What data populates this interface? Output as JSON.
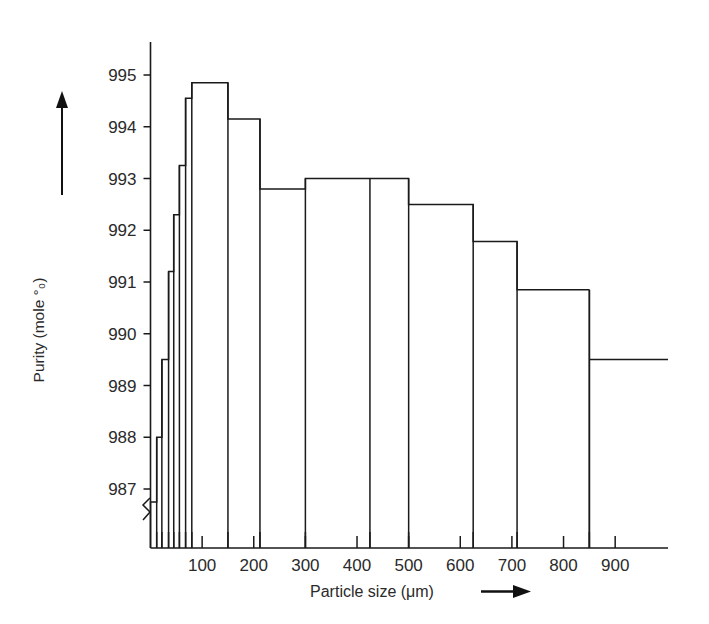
{
  "chart_data": {
    "type": "bar",
    "title": "",
    "xlabel": "Particle size  (μm)",
    "ylabel": "Purity (mole °₀)",
    "xlim": [
      0,
      1000
    ],
    "ylim": [
      986.4,
      995.4
    ],
    "grid": false,
    "legend": null,
    "axis_break": true,
    "x_ticks": [
      100,
      200,
      300,
      400,
      500,
      600,
      700,
      800,
      900
    ],
    "x_tick_labels": [
      "100",
      "200",
      "300",
      "400",
      "500",
      "600",
      "700",
      "800",
      "900"
    ],
    "y_ticks": [
      987,
      988,
      989,
      990,
      991,
      992,
      993,
      994,
      995
    ],
    "y_tick_labels": [
      "987",
      "988",
      "989",
      "990",
      "991",
      "992",
      "993",
      "994",
      "995"
    ],
    "bars": [
      {
        "x0": 0,
        "x1": 12,
        "value": 986.75,
        "label": "0-12"
      },
      {
        "x0": 12,
        "x1": 22,
        "value": 988.0,
        "label": "12-22"
      },
      {
        "x0": 22,
        "x1": 35,
        "value": 989.5,
        "label": "22-35"
      },
      {
        "x0": 35,
        "x1": 45,
        "value": 991.2,
        "label": "35-45"
      },
      {
        "x0": 45,
        "x1": 56,
        "value": 992.3,
        "label": "45-56"
      },
      {
        "x0": 56,
        "x1": 68,
        "value": 993.25,
        "label": "56-68"
      },
      {
        "x0": 68,
        "x1": 80,
        "value": 994.55,
        "label": "68-80"
      },
      {
        "x0": 80,
        "x1": 150,
        "value": 994.85,
        "label": "80-150"
      },
      {
        "x0": 150,
        "x1": 212,
        "value": 994.15,
        "label": "150-212"
      },
      {
        "x0": 212,
        "x1": 300,
        "value": 992.8,
        "label": "212-300"
      },
      {
        "x0": 300,
        "x1": 425,
        "value": 993.0,
        "label": "300-425"
      },
      {
        "x0": 425,
        "x1": 500,
        "value": 993.0,
        "label": "425-500"
      },
      {
        "x0": 500,
        "x1": 625,
        "value": 992.5,
        "label": "500-625"
      },
      {
        "x0": 625,
        "x1": 710,
        "value": 991.78,
        "label": "625-710"
      },
      {
        "x0": 710,
        "x1": 850,
        "value": 990.85,
        "label": "710-850"
      },
      {
        "x0": 850,
        "x1": 1010,
        "value": 989.5,
        "label": "850+"
      }
    ]
  },
  "axes": {
    "y_axis_arrow": "up-arrow-icon",
    "x_axis_arrow": "right-arrow-icon"
  }
}
